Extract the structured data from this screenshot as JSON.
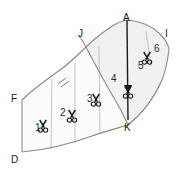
{
  "figure": {
    "background_color": "#ffffff",
    "outline_color": "#7a7a7a",
    "division_line_color": "#b5b5b5",
    "axis_line_color": "#1a1a1a",
    "shade_color": "#f0f0f0"
  },
  "point_labels": [
    {
      "id": "A",
      "text": "A",
      "x": 123,
      "y": 13
    },
    {
      "id": "J",
      "text": "J",
      "x": 78,
      "y": 29
    },
    {
      "id": "I",
      "text": "I",
      "x": 165,
      "y": 29
    },
    {
      "id": "F",
      "text": "F",
      "x": 11,
      "y": 94
    },
    {
      "id": "K",
      "text": "K",
      "x": 124,
      "y": 123
    },
    {
      "id": "D",
      "text": "D",
      "x": 11,
      "y": 155
    }
  ],
  "section_labels": [
    {
      "id": "1",
      "text": "1",
      "x": 35,
      "y": 123
    },
    {
      "id": "2",
      "text": "2",
      "x": 60,
      "y": 108
    },
    {
      "id": "3",
      "text": "3",
      "x": 87,
      "y": 94
    },
    {
      "id": "4",
      "text": "4",
      "x": 111,
      "y": 74
    },
    {
      "id": "5",
      "text": "5",
      "x": 138,
      "y": 61
    },
    {
      "id": "6",
      "text": "6",
      "x": 154,
      "y": 44
    }
  ],
  "scissors_markers": [
    {
      "id": "cut-1",
      "section": "1",
      "x": 43,
      "y": 127
    },
    {
      "id": "cut-2",
      "section": "2",
      "x": 72,
      "y": 117
    },
    {
      "id": "cut-3",
      "section": "3",
      "x": 96,
      "y": 101
    },
    {
      "id": "cut-4",
      "section": "4",
      "x": 121,
      "y": 84
    },
    {
      "id": "cut-5",
      "section": "5",
      "x": 144,
      "y": 60
    }
  ],
  "geometry": {
    "top_curve_F_to_A": "M 22,100 C 34,88 46,80 60,70 C 74,60 84,48 96,38 C 106,30 116,22 127,20",
    "top_right_curve_A_to_I": "M 127,20 C 140,21 152,26 160,34 C 165,39 168,44 169,49",
    "bottom_curve_D_to_K": "M 22,152 C 46,150 70,144 92,136 C 106,131 118,128 128,125",
    "bottom_right_curve_K_to_I": "M 128,125 C 142,114 154,98 162,80 C 166,70 168,58 169,49",
    "inner_curve_J_to_K": "M 82,40 C 92,58 102,78 114,98 C 120,108 125,118 128,125",
    "left_edge_F_to_D": "M 22,100 L 22,152",
    "axis_A_to_K": "M 127,20 L 128,123",
    "divider_1": "M 52,79 L 51,149",
    "divider_2": "M 75,63 L 75,143",
    "divider_3": "M 99,46 L 100,134",
    "divider_4": "M 146,31 L 151,66",
    "hash_marks": [
      "M 58,83 L 67,78",
      "M 60,86 L 69,81"
    ]
  }
}
